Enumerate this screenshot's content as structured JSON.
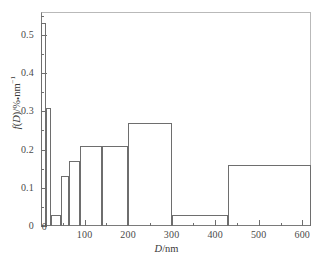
{
  "chart_data": {
    "type": "bar",
    "title": "",
    "subtitle": "",
    "xlabel": "D/nm",
    "ylabel": "f(D)/% • nm⁻¹",
    "xlim": [
      0,
      620
    ],
    "ylim": [
      0,
      0.56
    ],
    "grid": false,
    "legend": null,
    "style": "histogram-outline",
    "x_major_ticks": [
      0,
      100,
      200,
      300,
      400,
      500,
      600
    ],
    "x_minor_ticks": [
      50,
      150,
      250,
      350,
      450,
      550
    ],
    "y_major_ticks": [
      0,
      0.1,
      0.2,
      0.3,
      0.4,
      0.5
    ],
    "y_minor_ticks": [
      0.05,
      0.15,
      0.25,
      0.35,
      0.45,
      0.55
    ],
    "x_tick_labels": [
      "0",
      "100",
      "200",
      "300",
      "400",
      "500",
      "600"
    ],
    "y_tick_labels": [
      "0",
      "0.1",
      "0.2",
      "0.3",
      "0.4",
      "0.5"
    ],
    "bin_edges": [
      0,
      12,
      22,
      45,
      65,
      90,
      140,
      200,
      300,
      430,
      620
    ],
    "values": [
      0.53,
      0.31,
      0.03,
      0.13,
      0.17,
      0.21,
      0.21,
      0.27,
      0.03,
      0.16
    ],
    "bins": [
      {
        "x0": 0,
        "x1": 12,
        "value": 0.53
      },
      {
        "x0": 12,
        "x1": 22,
        "value": 0.31
      },
      {
        "x0": 22,
        "x1": 45,
        "value": 0.03
      },
      {
        "x0": 45,
        "x1": 65,
        "value": 0.13
      },
      {
        "x0": 65,
        "x1": 90,
        "value": 0.17
      },
      {
        "x0": 90,
        "x1": 140,
        "value": 0.21
      },
      {
        "x0": 140,
        "x1": 200,
        "value": 0.21
      },
      {
        "x0": 200,
        "x1": 300,
        "value": 0.27
      },
      {
        "x0": 300,
        "x1": 430,
        "value": 0.03
      },
      {
        "x0": 430,
        "x1": 620,
        "value": 0.16
      }
    ],
    "colors": {
      "bar_stroke": "#6e6e6e",
      "bar_fill": "none",
      "axis": "#6e6e6e",
      "frame": "#b9b9b9",
      "text": "#3a3a3a",
      "background": "#ffffff"
    }
  },
  "axis_titles": {
    "x_italic": "D",
    "x_rest": "/nm",
    "y_italic": "f",
    "y_paren": "(",
    "y_italic2": "D",
    "y_paren2": ")",
    "y_unit": "/%",
    "y_dot": "•",
    "y_nm": "nm",
    "y_exp": "−1"
  }
}
